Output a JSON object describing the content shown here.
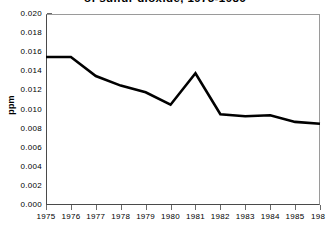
{
  "chart_data": {
    "type": "line",
    "title": "of sulfur dioxide, 1975-1986",
    "title_note": "Title is cut off at the top edge of the screenshot; only the second line is visible.",
    "xlabel": "",
    "ylabel": "ppm",
    "categories": [
      "1975",
      "1976",
      "1977",
      "1978",
      "1979",
      "1980",
      "1981",
      "1982",
      "1983",
      "1984",
      "1985",
      "1986"
    ],
    "x_tick_labels": [
      "1975",
      "1976",
      "1977",
      "1978",
      "1979",
      "1980",
      "1981",
      "1982",
      "1983",
      "1984",
      "1985",
      "198"
    ],
    "values": [
      0.0155,
      0.0155,
      0.0135,
      0.0125,
      0.0118,
      0.0105,
      0.0138,
      0.0095,
      0.0093,
      0.0094,
      0.0087,
      0.0085
    ],
    "ylim": [
      0.0,
      0.02
    ],
    "y_tick_labels": [
      "0.020",
      "0.018",
      "0.016",
      "0.014",
      "0.012",
      "0.010",
      "0.008",
      "0.006",
      "0.004",
      "0.002",
      "0.000"
    ],
    "y_tick_values": [
      0.02,
      0.018,
      0.016,
      0.014,
      0.012,
      0.01,
      0.008,
      0.006,
      0.004,
      0.002,
      0.0
    ],
    "grid": false,
    "legend": "none",
    "line_color": "#000000",
    "axis_color": "#6a6a6a",
    "background_color": "#ffffff"
  }
}
